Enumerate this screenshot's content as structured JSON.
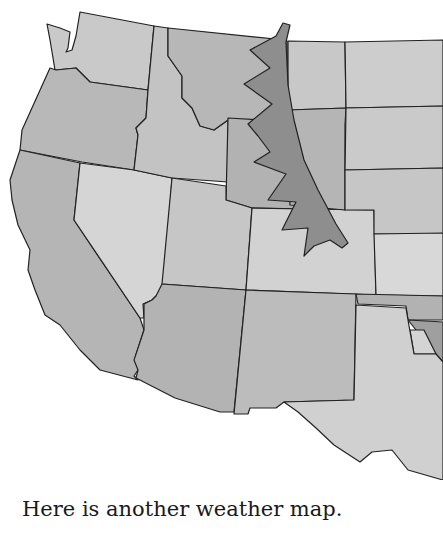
{
  "caption": "Here is another weather map.",
  "map": {
    "region": "Western United States",
    "style": "grayscale watercolor",
    "feature": "cold front",
    "colors": {
      "state_light": "#d6d6d6",
      "state_mid": "#bcbcbc",
      "state_dark": "#a5a5a5",
      "front": "#8e8e8e",
      "border": "#222222",
      "background": "#ffffff"
    }
  }
}
